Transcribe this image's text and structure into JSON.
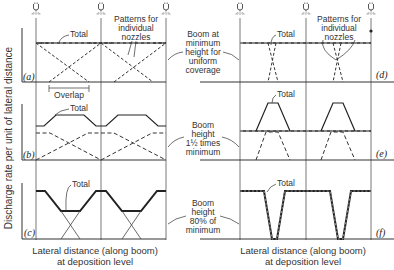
{
  "figure": {
    "y_axis_label": "Discharge rate per unit of lateral distance",
    "x_axis_label_left": [
      "Lateral distance (along boom)",
      "at deposition level"
    ],
    "x_axis_label_right": [
      "Lateral distance (along boom)",
      "at deposition level"
    ],
    "center_annotations": [
      {
        "row": "a-d",
        "lines": [
          "Boom at",
          "minimum",
          "height for",
          "uniform",
          "coverage"
        ]
      },
      {
        "row": "b-e",
        "lines": [
          "Boom",
          "height",
          "1½ times",
          "minimum"
        ]
      },
      {
        "row": "c-f",
        "lines": [
          "Boom",
          "height",
          "80% of",
          "minimum"
        ]
      }
    ],
    "panels": [
      {
        "id": "a",
        "label": "(a)",
        "total_label": "Total",
        "extra_labels": [
          "Patterns for",
          "individual",
          "nozzles"
        ],
        "overlap_label": "Overlap"
      },
      {
        "id": "b",
        "label": "(b)",
        "total_label": "Total"
      },
      {
        "id": "c",
        "label": "(c)",
        "total_label": "Total"
      },
      {
        "id": "d",
        "label": "(d)",
        "total_label": "Total",
        "extra_labels": [
          "Patterns for",
          "individual",
          "nozzles"
        ]
      },
      {
        "id": "e",
        "label": "(e)",
        "total_label": "Total"
      },
      {
        "id": "f",
        "label": "(f)",
        "total_label": "Total"
      }
    ],
    "icons": {
      "nozzle": "spray-nozzle-icon"
    },
    "colors": {
      "line": "#222222",
      "grid": "#555555",
      "background": "#ffffff"
    }
  }
}
